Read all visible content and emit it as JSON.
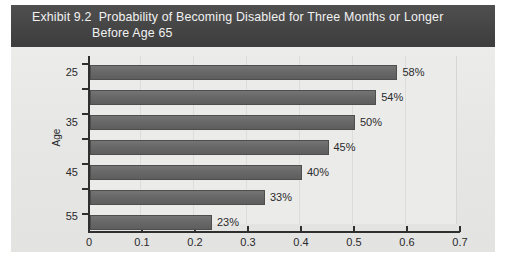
{
  "exhibit": {
    "number_label": "Exhibit 9.2",
    "title_line1": "Probability of Becoming Disabled for Three Months or Longer",
    "title_line2": "Before Age 65",
    "band_color": "#4a4a4a",
    "panel_color": "#e9e9e9"
  },
  "chart_data": {
    "type": "bar",
    "orientation": "horizontal",
    "title": "Probability of Becoming Disabled for Three Months or Longer Before Age 65",
    "xlabel": "",
    "ylabel": "Age",
    "categories": [
      "25",
      "30",
      "35",
      "40",
      "45",
      "50",
      "55"
    ],
    "values": [
      0.58,
      0.54,
      0.5,
      0.45,
      0.4,
      0.33,
      0.23
    ],
    "data_labels": [
      "58%",
      "54%",
      "50%",
      "45%",
      "40%",
      "33%",
      "23%"
    ],
    "visible_category_labels": [
      "25",
      "35",
      "45",
      "55"
    ],
    "xlim": [
      0,
      0.7
    ],
    "xticks": [
      "0",
      "0.1",
      "0.2",
      "0.3",
      "0.4",
      "0.5",
      "0.6",
      "0.7"
    ],
    "grid": true,
    "legend": false,
    "bar_color": "#6a6a6a",
    "axis_color": "#2f2f2f"
  }
}
